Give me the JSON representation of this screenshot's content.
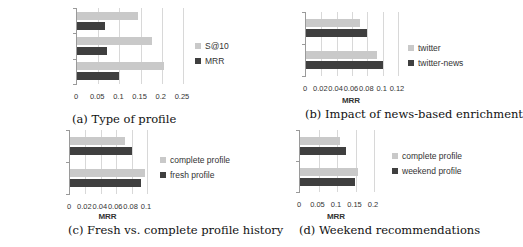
{
  "colors": {
    "light": "#c9c9c9",
    "dark": "#3f3f3f",
    "grid": "#d8d8d8"
  },
  "chart_data": [
    {
      "id": "a",
      "type": "bar",
      "orientation": "horizontal",
      "title": "(a) Type of profile",
      "xlabel": "",
      "ylabel": "",
      "categories": [
        "hashtag-based",
        "topic-based",
        "entity-based"
      ],
      "series": [
        {
          "name": "S@10",
          "color": "#c9c9c9",
          "values": [
            0.145,
            0.178,
            0.205
          ]
        },
        {
          "name": "MRR",
          "color": "#3f3f3f",
          "values": [
            0.065,
            0.07,
            0.1
          ]
        }
      ],
      "xticks": [
        "0",
        "0.05",
        "0.1",
        "0.15",
        "0.2",
        "0.25"
      ],
      "xlim": [
        0,
        0.25
      ],
      "grid": true,
      "legend_position": "right"
    },
    {
      "id": "b",
      "type": "bar",
      "orientation": "horizontal",
      "title": "(b) Impact of news-based enrichment",
      "xlabel": "MRR",
      "ylabel": "",
      "categories": [
        "topic-based",
        "entity-based"
      ],
      "series": [
        {
          "name": "twitter",
          "color": "#c9c9c9",
          "values": [
            0.071,
            0.092
          ]
        },
        {
          "name": "twitter-news",
          "color": "#3f3f3f",
          "values": [
            0.079,
            0.1
          ]
        }
      ],
      "xticks": [
        "0",
        "0.02",
        "0.04",
        "0.06",
        "0.08",
        "0.1",
        "0.12"
      ],
      "xlim": [
        0,
        0.12
      ],
      "grid": true,
      "legend_position": "right"
    },
    {
      "id": "c",
      "type": "bar",
      "orientation": "horizontal",
      "title": "(c) Fresh vs. complete profile history",
      "xlabel": "MRR",
      "ylabel": "",
      "categories": [
        "topic-based",
        "entity-based"
      ],
      "series": [
        {
          "name": "complete profile",
          "color": "#c9c9c9",
          "values": [
            0.072,
            0.097
          ]
        },
        {
          "name": "fresh profile",
          "color": "#3f3f3f",
          "values": [
            0.08,
            0.092
          ]
        }
      ],
      "xticks": [
        "0",
        "0.02",
        "0.04",
        "0.06",
        "0.08",
        "0.1"
      ],
      "xlim": [
        0,
        0.1
      ],
      "grid": true,
      "legend_position": "right"
    },
    {
      "id": "d",
      "type": "bar",
      "orientation": "horizontal",
      "title": "(d) Weekend recommendations",
      "xlabel": "MRR",
      "ylabel": "",
      "categories": [
        "topic-based",
        "entity-based"
      ],
      "series": [
        {
          "name": "complete profile",
          "color": "#c9c9c9",
          "values": [
            0.108,
            0.158
          ]
        },
        {
          "name": "weekend profile",
          "color": "#3f3f3f",
          "values": [
            0.123,
            0.148
          ]
        }
      ],
      "xticks": [
        "0",
        "0.05",
        "0.1",
        "0.15",
        "0.2"
      ],
      "xlim": [
        0,
        0.2
      ],
      "grid": true,
      "legend_position": "right"
    }
  ],
  "layout": [
    {
      "left": 76,
      "top": 8,
      "width": 106,
      "height": 76,
      "catRight": 72,
      "legendLeft": 195,
      "legendTop": 38,
      "captionLeft": 72,
      "captionTop": 112,
      "xlabelTop": 108
    },
    {
      "left": 305,
      "top": 12,
      "width": 92,
      "height": 64,
      "catRight": 298,
      "legendLeft": 408,
      "legendTop": 40,
      "captionLeft": 305,
      "captionTop": 107,
      "xlabelTop": 96
    },
    {
      "left": 69,
      "top": 130,
      "width": 77,
      "height": 64,
      "catRight": 62,
      "legendLeft": 160,
      "legendTop": 152,
      "captionLeft": 68,
      "captionTop": 223,
      "xlabelTop": 212
    },
    {
      "left": 299,
      "top": 130,
      "width": 74,
      "height": 62,
      "catRight": 292,
      "legendLeft": 392,
      "legendTop": 148,
      "captionLeft": 299,
      "captionTop": 223,
      "xlabelTop": 212
    }
  ]
}
